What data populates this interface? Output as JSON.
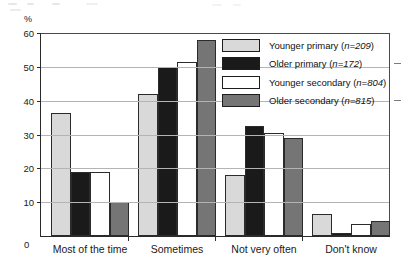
{
  "y_unit_label": "%",
  "x_zero_label": "0",
  "legend": {
    "position": "top-right-inside",
    "items": [
      {
        "label": "Younger primary (n=209)",
        "color": "#d9d9d9"
      },
      {
        "label": "Older primary (n=172)",
        "color": "#1a1a1a"
      },
      {
        "label": "Younger secondary (n=804)",
        "color": "#ffffff"
      },
      {
        "label": "Older secondary (n=815)",
        "color": "#757575"
      }
    ]
  },
  "chart_data": {
    "type": "bar",
    "title": "",
    "subtitle": "",
    "xlabel": "",
    "ylabel": "%",
    "ylim": [
      0,
      60
    ],
    "yticks": [
      0,
      10,
      20,
      30,
      40,
      50,
      60
    ],
    "grid": "horizontal",
    "legend_position": "top-right-inside",
    "categories": [
      "Most of the time",
      "Sometimes",
      "Not very often",
      "Don't know"
    ],
    "series": [
      {
        "name": "Younger primary (n=209)",
        "color": "#d9d9d9",
        "values": [
          36.5,
          42.0,
          18.0,
          6.5
        ]
      },
      {
        "name": "Older primary (n=172)",
        "color": "#1a1a1a",
        "values": [
          19.0,
          50.0,
          32.5,
          1.0
        ]
      },
      {
        "name": "Younger secondary (n=804)",
        "color": "#ffffff",
        "values": [
          19.0,
          51.5,
          30.5,
          3.5
        ]
      },
      {
        "name": "Older secondary (n=815)",
        "color": "#757575",
        "values": [
          10.0,
          58.0,
          29.0,
          4.5
        ]
      }
    ]
  }
}
